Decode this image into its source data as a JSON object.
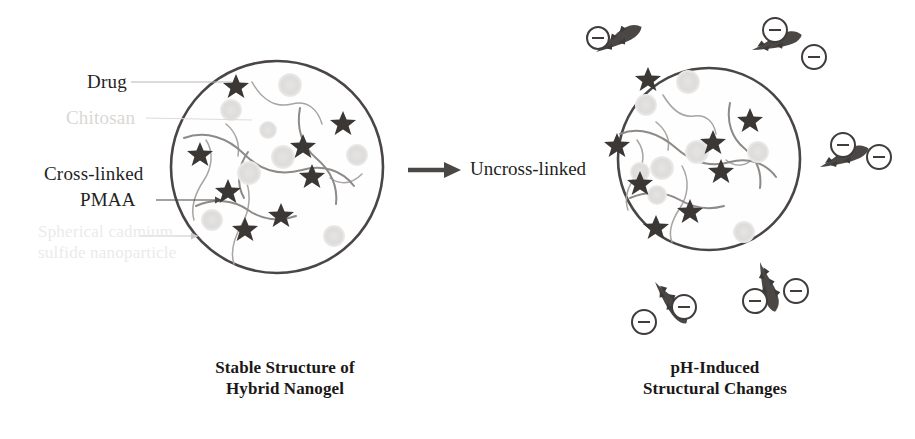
{
  "figure": {
    "type": "diagram",
    "background_color": "#ffffff"
  },
  "colors": {
    "ink": "#241f1d",
    "circle_outline": "#4a4645",
    "drug_star": "#3a3735",
    "nanoparticle": "#dedcda",
    "polymer_chain": "#8d8a88",
    "chain_dark": "#454241",
    "faded_text": "#d9d7d5",
    "faded_text_2": "#eceaea"
  },
  "left_panel": {
    "caption_line1": "Stable Structure of",
    "caption_line2": "Hybrid Nanogel",
    "labels": [
      {
        "id": "drug",
        "text": "Drug",
        "faded": false
      },
      {
        "id": "chitosan",
        "text": "Chitosan",
        "faded": true
      },
      {
        "id": "crosslinked",
        "text": "Cross-linked",
        "faded": false
      },
      {
        "id": "pmaa",
        "text": "PMAA",
        "faded": false
      },
      {
        "id": "nanoparticle-1",
        "text": "Spherical cadmium",
        "faded": true
      },
      {
        "id": "nanoparticle-2",
        "text": "sulfide nanoparticle",
        "faded": true
      }
    ],
    "legend_items": [
      {
        "symbol": "star",
        "meaning": "Drug"
      },
      {
        "symbol": "thin-curve",
        "meaning": "Chitosan"
      },
      {
        "symbol": "thick-curve",
        "meaning": "Cross-linked PMAA"
      },
      {
        "symbol": "faded-circle",
        "meaning": "Spherical cadmium sulfide nanoparticle"
      }
    ],
    "circle": {
      "cx": 277,
      "cy": 167,
      "r": 107
    },
    "counts": {
      "drug_stars": 8,
      "nanoparticles": 8,
      "chains": 7
    }
  },
  "transition": {
    "label": "Uncross-linked",
    "arrow_direction": "right"
  },
  "right_panel": {
    "caption_line1": "pH-Induced",
    "caption_line2": "Structural Changes",
    "circle": {
      "cx": 709,
      "cy": 159,
      "r": 92
    },
    "counts": {
      "drug_stars": 8,
      "nanoparticles": 8,
      "chains": 7,
      "external_chains": 5
    },
    "charge_symbol": "−",
    "charges_per_chain": 2,
    "total_negative_charges": 10
  }
}
